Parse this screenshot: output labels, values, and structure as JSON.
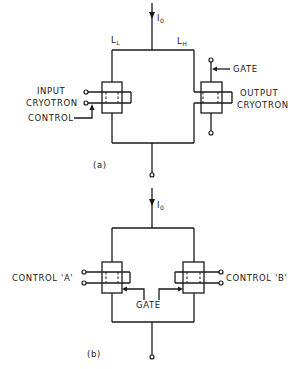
{
  "figure": {
    "diagram_a": {
      "caption": "(a)",
      "current_label": "I",
      "current_subscript": "0",
      "left_inductance": "L",
      "left_inductance_sub": "L",
      "right_inductance": "L",
      "right_inductance_sub": "H",
      "input_label_line1": "INPUT",
      "input_label_line2": "CRYOTRON",
      "control_label": "CONTROL",
      "gate_label": "GATE",
      "output_label_line1": "OUTPUT",
      "output_label_line2": "CRYOTRON"
    },
    "diagram_b": {
      "caption": "(b)",
      "current_label": "I",
      "current_subscript": "0",
      "control_a_label": "CONTROL 'A'",
      "control_b_label": "CONTROL 'B'",
      "gate_label": "GATE"
    },
    "colors": {
      "ink": "#1a1a1a",
      "background": "#ffffff"
    }
  }
}
